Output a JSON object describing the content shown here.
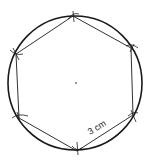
{
  "diagram": {
    "side_label": "3 cm",
    "colors": {
      "stroke": "#1a1a1a",
      "background": "#ffffff"
    },
    "circle": {
      "cx": 75,
      "cy": 83,
      "r": 67
    },
    "center_point": {
      "x": 76,
      "y": 83
    },
    "vertices": [
      {
        "x": 73,
        "y": 16
      },
      {
        "x": 131,
        "y": 48
      },
      {
        "x": 133,
        "y": 115
      },
      {
        "x": 77,
        "y": 151
      },
      {
        "x": 19,
        "y": 118
      },
      {
        "x": 16,
        "y": 54
      }
    ]
  }
}
